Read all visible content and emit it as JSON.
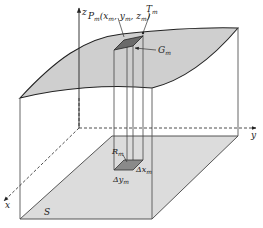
{
  "figure": {
    "type": "3d-surface-volume-diagram",
    "colors": {
      "surface_fill": "#cfcfcf",
      "floor_fill": "#dcdcdc",
      "patch_fill": "#7a7a7a",
      "line": "#333333",
      "background": "#ffffff"
    },
    "axes": {
      "z_label": "z",
      "y_label": "y",
      "x_label": "x"
    },
    "labels": {
      "point": "P",
      "point_sub": "m",
      "point_coords": "(x",
      "coord_x_sub": "m",
      "coord_y": ", y",
      "coord_y_sub": "m",
      "coord_z": ", z",
      "coord_z_sub": "m",
      "coord_close": ")",
      "tangent": "T",
      "tangent_sub": "m",
      "surface_patch": "G",
      "surface_patch_sub": "m",
      "region_patch": "R",
      "region_patch_sub": "m",
      "delta_x": "Δx",
      "delta_x_sub": "m",
      "delta_y": "Δy",
      "delta_y_sub": "m",
      "region": "S"
    }
  }
}
